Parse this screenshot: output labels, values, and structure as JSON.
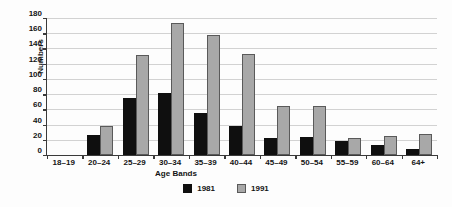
{
  "chart_data": {
    "type": "bar",
    "title": "",
    "xlabel": "Age Bands",
    "ylabel": "Numbers",
    "categories": [
      "18–19",
      "20–24",
      "25–29",
      "30–34",
      "35–39",
      "40–44",
      "45–49",
      "50–54",
      "55–59",
      "60–64",
      "64+"
    ],
    "series": [
      {
        "name": "1981",
        "color": "#0f0f0f",
        "values": [
          0,
          26,
          75,
          82,
          55,
          38,
          23,
          24,
          18,
          13,
          8
        ]
      },
      {
        "name": "1991",
        "color": "#a8a8a8",
        "values": [
          0,
          38,
          131,
          174,
          158,
          133,
          65,
          65,
          22,
          25,
          28
        ]
      }
    ],
    "ylim": [
      0,
      180
    ],
    "ytick_labels": [
      "0",
      "20",
      "40",
      "60",
      "80",
      "100",
      "120",
      "140",
      "160",
      "180"
    ],
    "ytick_values": [
      0,
      20,
      40,
      60,
      80,
      100,
      120,
      140,
      160,
      180
    ],
    "grid": true,
    "legend_position": "bottom-center",
    "legend": [
      "1981",
      "1991"
    ]
  }
}
